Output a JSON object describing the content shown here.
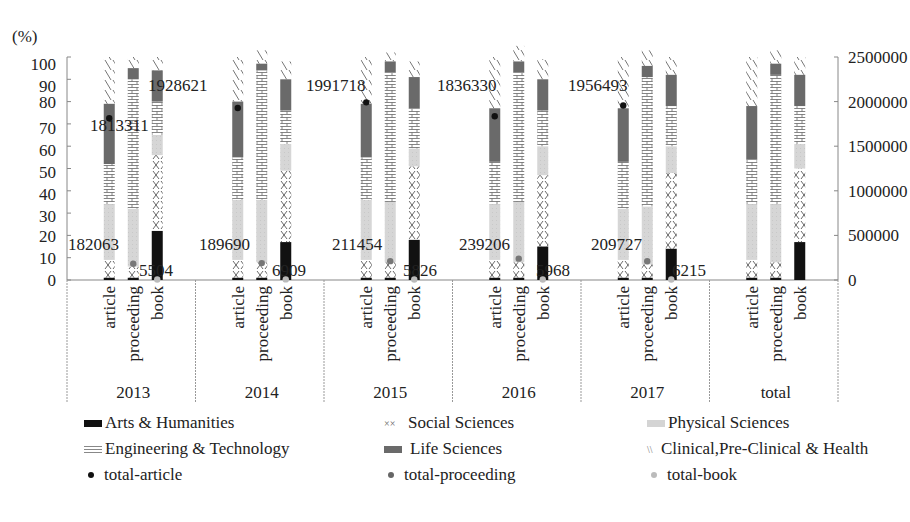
{
  "chart_data": {
    "type": "bar",
    "subtype": "stacked-percent-bar-with-dot-overlay",
    "title": "",
    "left_axis": {
      "label": "(%)",
      "ticks": [
        0,
        10,
        20,
        30,
        40,
        50,
        60,
        70,
        80,
        90,
        100
      ],
      "range": [
        0,
        100
      ]
    },
    "right_axis": {
      "label": "",
      "ticks": [
        0,
        500000,
        1000000,
        1500000,
        2000000,
        2500000
      ],
      "range": [
        0,
        2500000
      ]
    },
    "groups": [
      "2013",
      "2014",
      "2015",
      "2016",
      "2017",
      "total"
    ],
    "bar_types": [
      "article",
      "proceeding",
      "book"
    ],
    "segments": [
      "Arts & Humanities",
      "Social Sciences",
      "Physical Sciences",
      "Engineering & Technology",
      "Life Sciences",
      "Clinical,Pre-Clinical & Health"
    ],
    "series": [
      {
        "name": "Arts & Humanities",
        "values": [
          [
            1,
            1,
            22
          ],
          [
            1,
            1,
            17
          ],
          [
            1,
            1,
            18
          ],
          [
            1,
            1,
            15
          ],
          [
            1,
            1,
            14
          ],
          [
            1,
            1,
            17
          ]
        ]
      },
      {
        "name": "Social Sciences",
        "values": [
          [
            8,
            5,
            34
          ],
          [
            8,
            7,
            32
          ],
          [
            8,
            7,
            33
          ],
          [
            8,
            7,
            32
          ],
          [
            8,
            6,
            34
          ],
          [
            8,
            7,
            33
          ]
        ]
      },
      {
        "name": "Physical Sciences",
        "values": [
          [
            25,
            26,
            9
          ],
          [
            27,
            28,
            12
          ],
          [
            27,
            27,
            8
          ],
          [
            25,
            27,
            13
          ],
          [
            23,
            26,
            12
          ],
          [
            25,
            26,
            11
          ]
        ]
      },
      {
        "name": "Engineering & Technology",
        "values": [
          [
            18,
            58,
            15
          ],
          [
            19,
            58,
            15
          ],
          [
            19,
            58,
            18
          ],
          [
            19,
            58,
            16
          ],
          [
            21,
            58,
            18
          ],
          [
            20,
            58,
            17
          ]
        ]
      },
      {
        "name": "Life Sciences",
        "values": [
          [
            27,
            5,
            14
          ],
          [
            25,
            3,
            14
          ],
          [
            24,
            5,
            14
          ],
          [
            24,
            5,
            14
          ],
          [
            24,
            5,
            14
          ],
          [
            24,
            5,
            14
          ]
        ]
      },
      {
        "name": "Clinical,Pre-Clinical & Health",
        "values": [
          [
            21,
            5,
            6
          ],
          [
            20,
            6,
            8
          ],
          [
            21,
            4,
            7
          ],
          [
            23,
            7,
            9
          ],
          [
            23,
            7,
            8
          ],
          [
            22,
            6,
            8
          ]
        ]
      }
    ],
    "dot_series": [
      {
        "name": "total-article",
        "axis": "right",
        "values": [
          1813311,
          1928621,
          1991718,
          1836330,
          1956493,
          null
        ]
      },
      {
        "name": "total-proceeding",
        "axis": "right",
        "values": [
          182063,
          189690,
          211454,
          239206,
          209727,
          null
        ]
      },
      {
        "name": "total-book",
        "axis": "right",
        "values": [
          5504,
          6909,
          5826,
          5968,
          6215,
          null
        ]
      }
    ],
    "data_labels": [
      {
        "group": "2013",
        "article": "1813311",
        "proceeding": "182063",
        "book": "5504"
      },
      {
        "group": "2014",
        "article": "1928621",
        "proceeding": "189690",
        "book": "6909"
      },
      {
        "group": "2015",
        "article": "1991718",
        "proceeding": "211454",
        "book": "5826"
      },
      {
        "group": "2016",
        "article": "1836330",
        "proceeding": "239206",
        "book": "5968"
      },
      {
        "group": "2017",
        "article": "1956493",
        "proceeding": "209727",
        "book": "6215"
      }
    ],
    "legend_position": "bottom",
    "grid": false
  },
  "legend": {
    "items": [
      {
        "label": "Arts & Humanities",
        "kind": "swatch",
        "pattern": "solid-black"
      },
      {
        "label": "Social Sciences",
        "kind": "swatch",
        "pattern": "cross"
      },
      {
        "label": "Physical Sciences",
        "kind": "swatch",
        "pattern": "light-gray"
      },
      {
        "label": "Engineering & Technology",
        "kind": "swatch",
        "pattern": "brick"
      },
      {
        "label": "Life Sciences",
        "kind": "swatch",
        "pattern": "dark-gray"
      },
      {
        "label": "Clinical,Pre-Clinical & Health",
        "kind": "swatch",
        "pattern": "diagonal"
      },
      {
        "label": "total-article",
        "kind": "dot",
        "color": "#111111"
      },
      {
        "label": "total-proceeding",
        "kind": "dot",
        "color": "#666666"
      },
      {
        "label": "total-book",
        "kind": "dot",
        "color": "#bbbbbb"
      }
    ]
  },
  "colors": {
    "arts": "#111111",
    "social": "#ffffff",
    "physical": "#d4d4d4",
    "engineering": "#ffffff",
    "life": "#6a6a6a",
    "clinical": "#ffffff",
    "axis": "#777777",
    "text": "#222222"
  }
}
